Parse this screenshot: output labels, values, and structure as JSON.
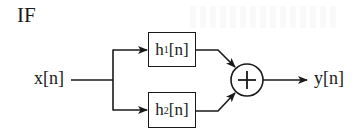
{
  "diagram": {
    "title": "IF",
    "input": {
      "label": "x[n]"
    },
    "output": {
      "label": "y[n]"
    },
    "blocks": [
      {
        "id": "h1",
        "base": "h",
        "subscript": "1",
        "suffix": "[n]"
      },
      {
        "id": "h2",
        "base": "h",
        "subscript": "2",
        "suffix": "[n]"
      }
    ],
    "summer": {
      "symbol": "+"
    },
    "edges": [
      {
        "from": "x[n]",
        "to": "h1"
      },
      {
        "from": "x[n]",
        "to": "h2"
      },
      {
        "from": "h1",
        "to": "summer"
      },
      {
        "from": "h2",
        "to": "summer"
      },
      {
        "from": "summer",
        "to": "y[n]"
      }
    ],
    "colors": {
      "stroke": "#1a1a1a",
      "background": "#ffffff"
    }
  }
}
